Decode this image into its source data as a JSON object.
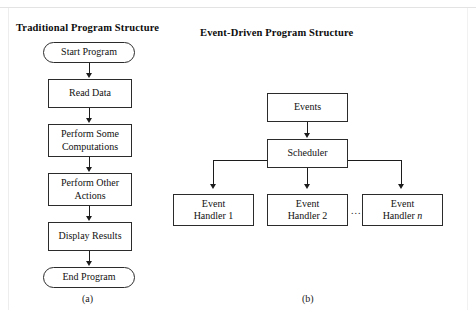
{
  "figure": {
    "panels": [
      {
        "id": "traditional",
        "title": "Traditional Program Structure",
        "caption": "(a)",
        "nodes": [
          {
            "name": "start-program",
            "shape": "terminal",
            "label": "Start Program"
          },
          {
            "name": "read-data",
            "shape": "box",
            "label": "Read Data"
          },
          {
            "name": "perform-some-computations",
            "shape": "box",
            "label": "Perform Some\nComputations"
          },
          {
            "name": "perform-other-actions",
            "shape": "box",
            "label": "Perform Other\nActions"
          },
          {
            "name": "display-results",
            "shape": "box",
            "label": "Display Results"
          },
          {
            "name": "end-program",
            "shape": "terminal",
            "label": "End Program"
          }
        ]
      },
      {
        "id": "event-driven",
        "title": "Event-Driven Program Structure",
        "caption": "(b)",
        "nodes": [
          {
            "name": "events",
            "shape": "box",
            "label": "Events"
          },
          {
            "name": "scheduler",
            "shape": "box",
            "label": "Scheduler"
          },
          {
            "name": "event-handler-1",
            "shape": "box",
            "label": "Event\nHandler 1"
          },
          {
            "name": "event-handler-2",
            "shape": "box",
            "label": "Event\nHandler 2"
          },
          {
            "name": "event-handler-n",
            "shape": "box",
            "label": "Event\nHandler n",
            "italic_tail": "n"
          }
        ],
        "ellipsis": "..."
      }
    ],
    "colors": {
      "background": "#ffffff",
      "stroke": "#2b2b2b",
      "connector": "#1c1c1c",
      "text": "#111111"
    }
  }
}
